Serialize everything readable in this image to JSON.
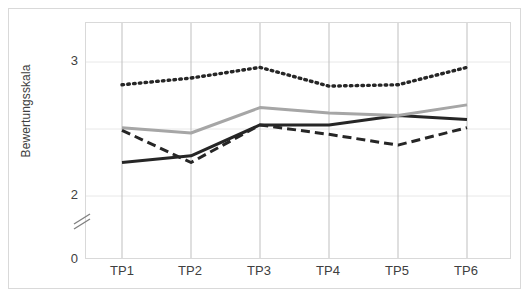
{
  "chart_data": {
    "type": "line",
    "title": "",
    "xlabel": "",
    "ylabel": "Bewertungsskala",
    "categories": [
      "TP1",
      "TP2",
      "TP3",
      "TP4",
      "TP5",
      "TP6"
    ],
    "ylim": [
      0,
      3.2
    ],
    "yticks": [
      "0",
      "2",
      "3"
    ],
    "ytick_values": [
      0,
      2,
      3
    ],
    "gridlines": [
      2,
      2.5,
      3
    ],
    "axis_break": true,
    "axis_break_between": [
      0,
      2
    ],
    "grid": true,
    "legend": "none",
    "series": [
      {
        "name": "series-solid-black",
        "style": "solid",
        "color": "#262626",
        "values": [
          2.25,
          2.3,
          2.53,
          2.53,
          2.6,
          2.57
        ]
      },
      {
        "name": "series-gray",
        "style": "solid",
        "color": "#a6a6a6",
        "values": [
          2.51,
          2.47,
          2.66,
          2.62,
          2.6,
          2.68
        ]
      },
      {
        "name": "series-dashed",
        "style": "dashed",
        "color": "#262626",
        "values": [
          2.49,
          2.25,
          2.53,
          2.46,
          2.38,
          2.51
        ]
      },
      {
        "name": "series-dotted",
        "style": "dotted",
        "color": "#262626",
        "values": [
          2.83,
          2.88,
          2.96,
          2.82,
          2.83,
          2.96
        ]
      }
    ]
  },
  "axis": {
    "y_label_text": "Bewertungsskala",
    "y_ticks": [
      "3",
      "2",
      "0"
    ],
    "x_ticks": [
      "TP1",
      "TP2",
      "TP3",
      "TP4",
      "TP5",
      "TP6"
    ]
  },
  "colors": {
    "frame": "#d9d9d9",
    "grid": "#e8e8e8",
    "axis_line": "#bfbfbf",
    "text": "#404040",
    "dark_series": "#262626",
    "gray_series": "#a6a6a6"
  }
}
